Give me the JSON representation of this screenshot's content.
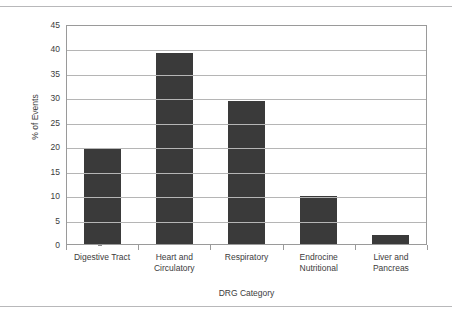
{
  "chart_data": {
    "type": "bar",
    "title": "",
    "xlabel": "DRG Category",
    "ylabel": "% of Events",
    "categories": [
      "Digestive Tract",
      "Heart and Circulatory",
      "Respiratory",
      "Endrocine Nutritional",
      "Liver and Pancreas"
    ],
    "values": [
      19.5,
      39.0,
      29.2,
      9.8,
      1.9
    ],
    "ylim": [
      0,
      45
    ],
    "ytick_step": 5,
    "yticks": [
      0,
      5,
      10,
      15,
      20,
      25,
      30,
      35,
      40,
      45
    ],
    "ytick_labels": [
      "0",
      "5",
      "10",
      "15",
      "20",
      "25",
      "30",
      "35",
      "40",
      "45"
    ],
    "grid": true,
    "grid_axis": "y",
    "legend": false,
    "bar_color": "#3a3a3a",
    "gridline_color": "#b5b5b5",
    "axis_color": "#9a9a9a",
    "text_color": "#3c3c3c",
    "background_color": "#ffffff"
  },
  "category_lines": [
    [
      "Digestive Tract"
    ],
    [
      "Heart and",
      "Circulatory"
    ],
    [
      "Respiratory"
    ],
    [
      "Endrocine",
      "Nutritional"
    ],
    [
      "Liver and",
      "Pancreas"
    ]
  ]
}
